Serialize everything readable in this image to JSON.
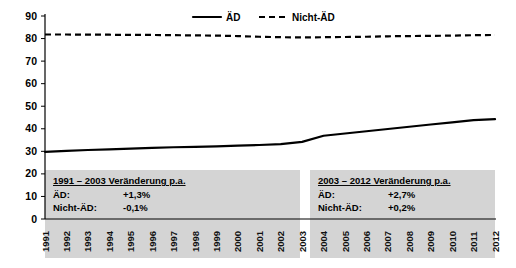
{
  "chart_data": {
    "type": "line",
    "title": "",
    "xlabel": "",
    "ylabel": "",
    "ylim": [
      0,
      90
    ],
    "ytick_step": 10,
    "yticks": [
      "0",
      "10",
      "20",
      "30",
      "40",
      "50",
      "60",
      "70",
      "80",
      "90"
    ],
    "grid": false,
    "legend_position": "top-center",
    "categories": [
      "1991",
      "1992",
      "1993",
      "1994",
      "1995",
      "1996",
      "1997",
      "1998",
      "1999",
      "2000",
      "2001",
      "2002",
      "2003",
      "2004",
      "2005",
      "2006",
      "2007",
      "2008",
      "2009",
      "2010",
      "2011",
      "2012"
    ],
    "series": [
      {
        "name": "ÄD",
        "style": "solid",
        "color": "#000000",
        "values": [
          29.8,
          30.2,
          30.6,
          30.9,
          31.2,
          31.5,
          31.8,
          32.0,
          32.2,
          32.5,
          32.8,
          33.2,
          34.2,
          36.9,
          37.9,
          38.9,
          39.9,
          40.9,
          41.9,
          42.8,
          43.8,
          44.3
        ]
      },
      {
        "name": "Nicht-ÄD",
        "style": "dashed",
        "color": "#000000",
        "values": [
          81.8,
          81.8,
          81.7,
          81.7,
          81.6,
          81.6,
          81.5,
          81.4,
          81.3,
          81.1,
          80.8,
          80.6,
          80.5,
          80.6,
          80.7,
          80.8,
          81.0,
          81.1,
          81.2,
          81.3,
          81.5,
          81.6
        ]
      }
    ],
    "annotations": [
      {
        "id": "left-note",
        "title": "1991 – 2003 Veränderung p.a.",
        "rows": [
          {
            "key": "ÄD:",
            "value": "+1,3%"
          },
          {
            "key": "Nicht-ÄD:",
            "value": "-0,1%"
          }
        ]
      },
      {
        "id": "right-note",
        "title": "2003 – 2012 Veränderung p.a.",
        "rows": [
          {
            "key": "ÄD:",
            "value": "+2,7%"
          },
          {
            "key": "Nicht-ÄD:",
            "value": "+0,2%"
          }
        ]
      }
    ]
  },
  "legend": {
    "items": [
      {
        "label": "ÄD",
        "style": "solid"
      },
      {
        "label": "Nicht-ÄD",
        "style": "dashed"
      }
    ]
  },
  "colors": {
    "series": "#000000",
    "note_background": "#d4d4d4",
    "axis": "#000000",
    "plot_background": "#ffffff"
  }
}
